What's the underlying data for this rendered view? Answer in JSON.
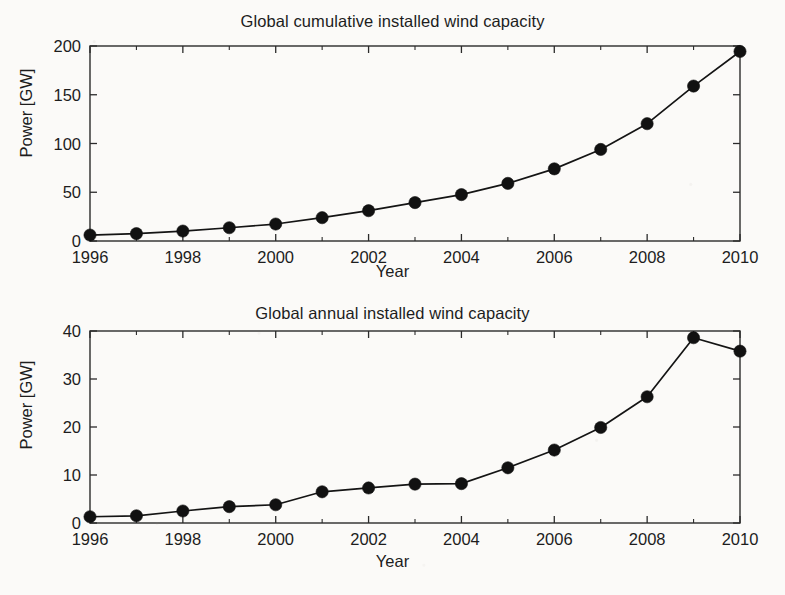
{
  "figure": {
    "background_color": "#fbfaf8",
    "ink_color": "#141414"
  },
  "panels": {
    "cumulative": {
      "title": "Global cumulative installed wind capacity",
      "xlabel": "Year",
      "ylabel": "Power [GW]",
      "y_ticklabels": [
        "200",
        "150",
        "100",
        "50",
        "0"
      ],
      "x_ticklabels": [
        "1996",
        "1998",
        "2000",
        "2002",
        "2004",
        "2006",
        "2008",
        "2010"
      ]
    },
    "annual": {
      "title": "Global annual installed wind capacity",
      "xlabel": "Year",
      "ylabel": "Power [GW]",
      "y_ticklabels": [
        "40",
        "30",
        "20",
        "10",
        "0"
      ],
      "x_ticklabels": [
        "1996",
        "1998",
        "2000",
        "2002",
        "2004",
        "2006",
        "2008",
        "2010"
      ]
    }
  },
  "chart_data": [
    {
      "type": "line",
      "id": "cumulative",
      "title": "Global cumulative installed wind capacity",
      "xlabel": "Year",
      "ylabel": "Power [GW]",
      "x": [
        1996,
        1997,
        1998,
        1999,
        2000,
        2001,
        2002,
        2003,
        2004,
        2005,
        2006,
        2007,
        2008,
        2009,
        2010
      ],
      "values": [
        6.1,
        7.6,
        10.2,
        13.6,
        17.4,
        23.9,
        31.1,
        39.4,
        47.6,
        59.1,
        74.0,
        93.9,
        120.3,
        158.9,
        194.4
      ],
      "xlim": [
        1996,
        2010
      ],
      "ylim": [
        0,
        200
      ],
      "xticks": [
        1996,
        1998,
        2000,
        2002,
        2004,
        2006,
        2008,
        2010
      ],
      "xticks_minor": [
        1997,
        1999,
        2001,
        2003,
        2005,
        2007,
        2009
      ],
      "yticks": [
        0,
        50,
        100,
        150,
        200
      ],
      "grid": false,
      "legend": false,
      "marker": "filled-circle",
      "marker_color": "#111111",
      "line_color": "#141414"
    },
    {
      "type": "line",
      "id": "annual",
      "title": "Global annual installed wind capacity",
      "xlabel": "Year",
      "ylabel": "Power [GW]",
      "x": [
        1996,
        1997,
        1998,
        1999,
        2000,
        2001,
        2002,
        2003,
        2004,
        2005,
        2006,
        2007,
        2008,
        2009,
        2010
      ],
      "values": [
        1.3,
        1.5,
        2.5,
        3.4,
        3.8,
        6.5,
        7.3,
        8.1,
        8.2,
        11.5,
        15.2,
        19.9,
        26.3,
        38.6,
        35.8
      ],
      "xlim": [
        1996,
        2010
      ],
      "ylim": [
        0,
        40
      ],
      "xticks": [
        1996,
        1998,
        2000,
        2002,
        2004,
        2006,
        2008,
        2010
      ],
      "xticks_minor": [
        1997,
        1999,
        2001,
        2003,
        2005,
        2007,
        2009
      ],
      "yticks": [
        0,
        10,
        20,
        30,
        40
      ],
      "grid": false,
      "legend": false,
      "marker": "filled-circle",
      "marker_color": "#111111",
      "line_color": "#141414"
    }
  ]
}
